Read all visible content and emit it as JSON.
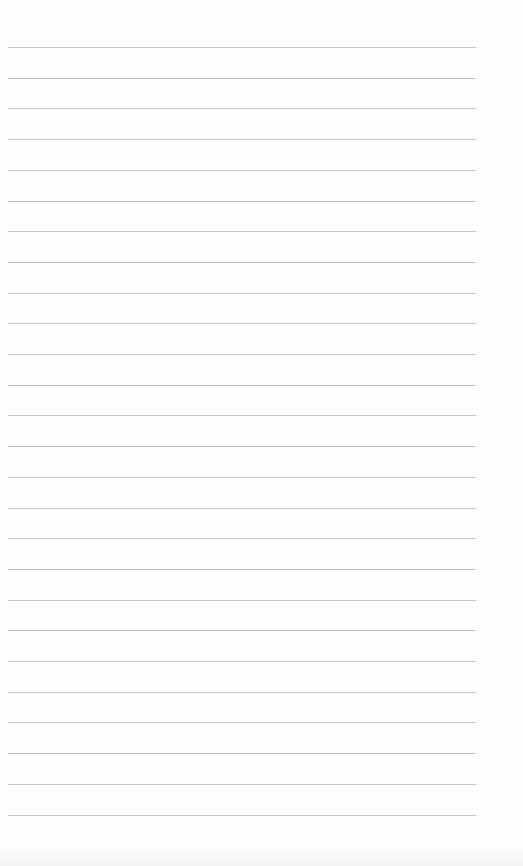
{
  "page": {
    "type": "lined-paper",
    "background_color": "#ffffff",
    "rule_color": "#c4c4c4",
    "rule_count": 26,
    "rule_start_y": 47,
    "rule_spacing": 30.7,
    "rule_left": 8,
    "rule_width": 468,
    "text_lines": []
  }
}
